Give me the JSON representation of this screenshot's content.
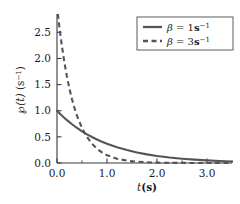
{
  "chart_data": {
    "type": "line",
    "title": "",
    "subtitle": "",
    "xlabel": "t(s)",
    "xlabel_parts": {
      "symbol": "t",
      "unit": "(s)"
    },
    "ylabel": "℘(t) (s⁻¹)",
    "ylabel_parts": {
      "symbol": "℘",
      "arg": "(t)",
      "unit_base": "(s",
      "unit_exp": "−1",
      "unit_close": ")"
    },
    "xlim": [
      0.0,
      3.5
    ],
    "ylim": [
      0.0,
      2.85
    ],
    "xticks": [
      0.0,
      1.0,
      2.0,
      3.0
    ],
    "xticklabels": [
      "0.0",
      "1.0",
      "2.0",
      "3.0"
    ],
    "xminorticks": [
      0.5,
      1.5,
      2.5,
      3.5
    ],
    "yticks": [
      0.0,
      0.5,
      1.0,
      1.5,
      2.0,
      2.5
    ],
    "yticklabels": [
      "0.0",
      "0.5",
      "1.0",
      "1.5",
      "2.0",
      "2.5"
    ],
    "grid": false,
    "legend_position": "upper right",
    "line_color": "#555555",
    "axis_color": "#3a3a3a",
    "background_color": "#ffffff",
    "function_form": "p(t) = beta * exp(-beta * t)",
    "series": [
      {
        "name": "β = 1s⁻¹",
        "beta": 1,
        "style": "solid",
        "color": "#555555",
        "legend_parts": {
          "symbol": "β",
          "equals": "=",
          "value": "1",
          "unit": "s",
          "exp": "−1"
        },
        "x": [
          0.0,
          0.1,
          0.2,
          0.3,
          0.4,
          0.5,
          0.6,
          0.7,
          0.8,
          0.9,
          1.0,
          1.2,
          1.4,
          1.6,
          1.8,
          2.0,
          2.25,
          2.5,
          2.75,
          3.0,
          3.25,
          3.5
        ],
        "values": [
          1.0,
          0.905,
          0.819,
          0.741,
          0.67,
          0.607,
          0.549,
          0.497,
          0.449,
          0.407,
          0.368,
          0.301,
          0.247,
          0.202,
          0.165,
          0.135,
          0.105,
          0.082,
          0.064,
          0.05,
          0.039,
          0.03
        ]
      },
      {
        "name": "β = 3s⁻¹",
        "beta": 3,
        "style": "dashed",
        "color": "#555555",
        "legend_parts": {
          "symbol": "β",
          "equals": "=",
          "value": "3",
          "unit": "s",
          "exp": "−1"
        },
        "x": [
          0.0,
          0.05,
          0.1,
          0.15,
          0.2,
          0.25,
          0.3,
          0.35,
          0.4,
          0.5,
          0.6,
          0.7,
          0.8,
          0.9,
          1.0,
          1.2,
          1.4,
          1.6,
          1.8,
          2.0,
          2.25,
          2.5,
          2.75,
          3.0,
          3.25,
          3.5
        ],
        "values": [
          3.0,
          2.582,
          2.222,
          1.913,
          1.646,
          1.417,
          1.22,
          1.05,
          0.904,
          0.669,
          0.496,
          0.367,
          0.272,
          0.202,
          0.149,
          0.082,
          0.045,
          0.025,
          0.014,
          0.007,
          0.003,
          0.002,
          0.001,
          0.0,
          0.0,
          0.0
        ]
      }
    ],
    "annotations": {
      "crossing_point": {
        "t": 0.55,
        "y": 0.58
      }
    }
  }
}
